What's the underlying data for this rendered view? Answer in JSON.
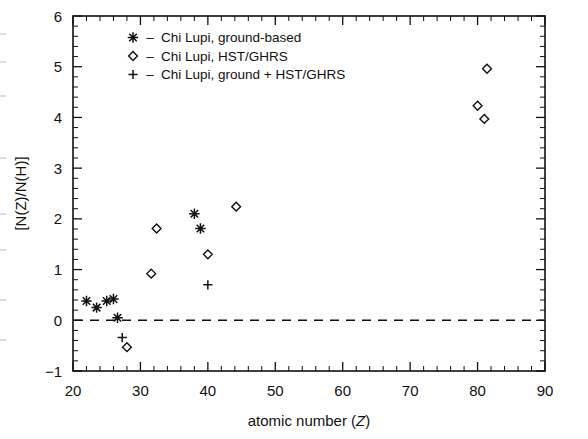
{
  "figure": {
    "background": "#ffffff",
    "ink_color": "#111111"
  },
  "axes": {
    "x_label_prefix": "atomic number (",
    "x_label_italic": "Z",
    "x_label_suffix": ")",
    "y_label": "[N(Z)/N(H)]",
    "x_ticks": [
      "20",
      "30",
      "40",
      "50",
      "60",
      "70",
      "80",
      "90"
    ],
    "y_ticks": [
      "-1",
      "0",
      "1",
      "2",
      "3",
      "4",
      "5",
      "6"
    ]
  },
  "legend": {
    "entries": [
      {
        "marker": "asterisk-marker",
        "dash": "–",
        "label": "Chi Lupi, ground-based"
      },
      {
        "marker": "diamond-marker",
        "dash": "–",
        "label": "Chi Lupi, HST/GHRS"
      },
      {
        "marker": "plus-marker",
        "dash": "–",
        "label": "Chi Lupi, ground + HST/GHRS"
      }
    ]
  },
  "chart_data": {
    "type": "scatter",
    "title": "",
    "xlabel": "atomic number (Z)",
    "ylabel": "[N(Z)/N(H)]",
    "xlim": [
      20,
      90
    ],
    "ylim": [
      -1,
      6
    ],
    "xticks": [
      20,
      30,
      40,
      50,
      60,
      70,
      80,
      90
    ],
    "yticks": [
      -1,
      0,
      1,
      2,
      3,
      4,
      5,
      6
    ],
    "grid": false,
    "legend_position": "upper-left-inside",
    "reference_line": {
      "y": 0,
      "style": "dashed",
      "label": ""
    },
    "series": [
      {
        "name": "Chi Lupi, ground-based",
        "marker": "asterisk",
        "points": [
          {
            "x": 22.0,
            "y": 0.38
          },
          {
            "x": 23.5,
            "y": 0.25
          },
          {
            "x": 25.0,
            "y": 0.38
          },
          {
            "x": 26.0,
            "y": 0.42
          },
          {
            "x": 26.6,
            "y": 0.05
          },
          {
            "x": 38.0,
            "y": 2.1
          },
          {
            "x": 38.9,
            "y": 1.81
          }
        ]
      },
      {
        "name": "Chi Lupi, HST/GHRS",
        "marker": "diamond",
        "points": [
          {
            "x": 28.0,
            "y": -0.53
          },
          {
            "x": 31.6,
            "y": 0.92
          },
          {
            "x": 32.4,
            "y": 1.81
          },
          {
            "x": 40.0,
            "y": 1.3
          },
          {
            "x": 44.2,
            "y": 2.24
          },
          {
            "x": 80.0,
            "y": 4.23
          },
          {
            "x": 81.0,
            "y": 3.97
          },
          {
            "x": 81.4,
            "y": 4.96
          }
        ]
      },
      {
        "name": "Chi Lupi, ground + HST/GHRS",
        "marker": "plus",
        "points": [
          {
            "x": 27.3,
            "y": -0.34
          },
          {
            "x": 40.0,
            "y": 0.7
          }
        ]
      }
    ]
  }
}
